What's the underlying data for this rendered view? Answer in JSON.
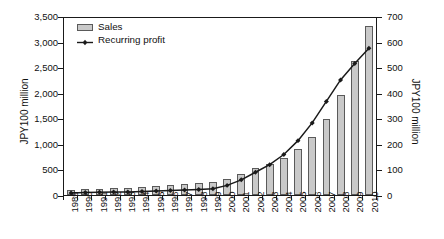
{
  "chart_data": {
    "type": "bar",
    "title": "",
    "subtitle": "",
    "xlabel": "",
    "ylabel": "JPY100 million",
    "ylabel_right": "JPY100 million",
    "grid": false,
    "legend_position": "top-left",
    "categories": [
      "1989",
      "1990",
      "1991",
      "1992",
      "1993",
      "1994",
      "1995",
      "1996",
      "1997",
      "1998",
      "1999",
      "2000",
      "2001",
      "2002",
      "2003",
      "2004",
      "2005",
      "2006",
      "2007",
      "2008",
      "2009",
      "2010"
    ],
    "ylim": [
      0,
      3500
    ],
    "yticks": [
      0,
      500,
      1000,
      1500,
      2000,
      2500,
      3000,
      3500
    ],
    "ytick_labels": [
      "0",
      "500",
      "1,000",
      "1,500",
      "2,000",
      "2,500",
      "3,000",
      "3,500"
    ],
    "ylim_right": [
      0,
      700
    ],
    "yticks_right": [
      0,
      100,
      200,
      300,
      400,
      500,
      600,
      700
    ],
    "ytick_labels_right": [
      "0",
      "100",
      "200",
      "300",
      "400",
      "500",
      "600",
      "700"
    ],
    "series": [
      {
        "name": "Sales",
        "type": "bar",
        "axis": "left",
        "color": "#c9c9c9",
        "edge_color": "#5a5a5a",
        "values": [
          95,
          110,
          120,
          130,
          135,
          155,
          170,
          200,
          215,
          235,
          250,
          320,
          420,
          530,
          610,
          730,
          900,
          1130,
          1480,
          1950,
          2620,
          3300
        ]
      },
      {
        "name": "Recurring profit",
        "type": "line",
        "axis": "right",
        "color": "#1a1a1a",
        "marker": "diamond",
        "values": [
          8,
          10,
          11,
          12,
          12,
          14,
          16,
          18,
          20,
          22,
          25,
          38,
          60,
          90,
          120,
          160,
          215,
          285,
          370,
          455,
          520,
          580
        ]
      }
    ]
  },
  "legend": {
    "items": [
      {
        "label": "Sales",
        "swatch": "bar-swatch-icon"
      },
      {
        "label": "Recurring profit",
        "swatch": "line-marker-icon"
      }
    ]
  },
  "axes": {
    "left_title": "JPY100 million",
    "right_title": "JPY100 million"
  }
}
